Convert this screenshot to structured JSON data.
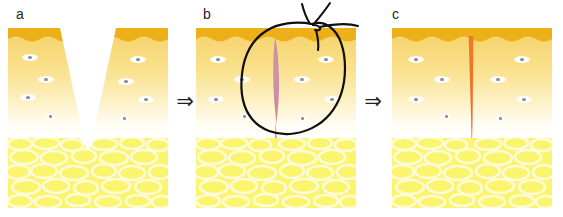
{
  "figure": {
    "kind": "scientific-illustration",
    "width": 563,
    "height": 217,
    "background": "#ffffff"
  },
  "panels": [
    {
      "id": "a",
      "label": "a",
      "caption": "open V-shaped wound through epidermis and dermis",
      "state": "open-wound"
    },
    {
      "id": "b",
      "label": "b",
      "caption": "wound closed with suture, lens-shaped pink wound bed",
      "state": "sutured"
    },
    {
      "id": "c",
      "label": "c",
      "caption": "healed wound leaving a narrow orange scar",
      "state": "healed-scar"
    }
  ],
  "arrows": [
    {
      "id": "arrow-1",
      "glyph": "⇒",
      "meaning": "progresses-to"
    },
    {
      "id": "arrow-2",
      "glyph": "⇒",
      "meaning": "progresses-to"
    }
  ],
  "layers": [
    {
      "name": "epidermis",
      "color": "#edb019"
    },
    {
      "name": "dermis",
      "color": "#f7d878"
    },
    {
      "name": "subcutaneous-fat",
      "color": "#fbf46d"
    }
  ],
  "colors": {
    "epidermis": "#edb019",
    "dermis_top": "#f4cf6a",
    "dermis_bottom": "#ffffff",
    "fat": "#fbf46d",
    "fat_border": "#fffbd0",
    "wound_pink": "#cf8fa2",
    "scar_orange": "#f07629",
    "suture_thread": "#1a1a1a",
    "marker_ink": "#0f0f0f",
    "cell_nucleus": "#8c8f9c",
    "label_text": "#231f20"
  },
  "annotation": {
    "marker_circle": "hand-drawn ink circle highlighting the sutured wound in panel b",
    "suture": "black suture thread with knot above the skin surface in panel b"
  }
}
